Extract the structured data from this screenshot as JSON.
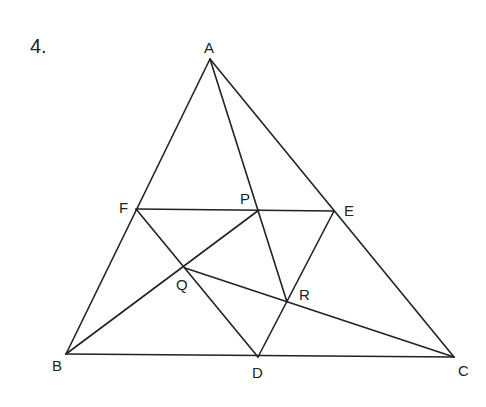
{
  "problem_number": "4.",
  "points": {
    "A": {
      "label": "A",
      "x": 210,
      "y": 59
    },
    "B": {
      "label": "B",
      "x": 66,
      "y": 354
    },
    "C": {
      "label": "C",
      "x": 454,
      "y": 357
    },
    "D": {
      "label": "D",
      "x": 258,
      "y": 357
    },
    "E": {
      "label": "E",
      "x": 334,
      "y": 211
    },
    "F": {
      "label": "F",
      "x": 136,
      "y": 209
    },
    "P": {
      "label": "P",
      "x": 259,
      "y": 210
    },
    "Q": {
      "label": "Q",
      "x": 185,
      "y": 268
    },
    "R": {
      "label": "R",
      "x": 287,
      "y": 302
    }
  },
  "segments": [
    [
      "A",
      "B"
    ],
    [
      "A",
      "C"
    ],
    [
      "B",
      "C"
    ],
    [
      "F",
      "E"
    ],
    [
      "F",
      "D"
    ],
    [
      "D",
      "E"
    ],
    [
      "A",
      "R"
    ],
    [
      "B",
      "P"
    ],
    [
      "C",
      "Q"
    ]
  ],
  "line_color": "#222222"
}
